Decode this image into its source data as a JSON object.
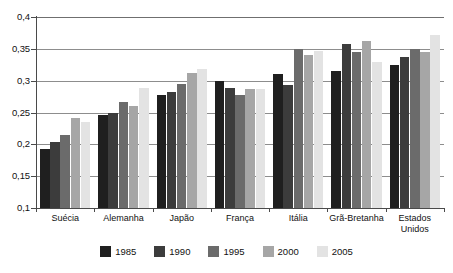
{
  "chart_data": {
    "type": "bar",
    "title": "",
    "subtitle": "",
    "xlabel": "",
    "ylabel": "",
    "ylim": [
      0.1,
      0.4
    ],
    "y_ticks": [
      "0,1",
      "0,15",
      "0,2",
      "0,25",
      "0,3",
      "0,35",
      "0,4"
    ],
    "y_tick_values": [
      0.1,
      0.15,
      0.2,
      0.25,
      0.3,
      0.35,
      0.4
    ],
    "grid": true,
    "grid_axis": "y",
    "legend_position": "bottom",
    "decimal_separator": ",",
    "categories": [
      "Suécia",
      "Alemanha",
      "Japão",
      "França",
      "Itália",
      "Grã-Bretanha",
      "Estados\nUnidos"
    ],
    "series": [
      {
        "name": "1985",
        "color": "#1f1f1f",
        "values": [
          0.193,
          0.246,
          0.277,
          0.3,
          0.31,
          0.315,
          0.325
        ]
      },
      {
        "name": "1990",
        "color": "#3c3c3c",
        "values": [
          0.204,
          0.25,
          0.283,
          0.289,
          0.293,
          0.357,
          0.337
        ]
      },
      {
        "name": "1995",
        "color": "#6b6b6b",
        "values": [
          0.214,
          0.266,
          0.295,
          0.278,
          0.35,
          0.345,
          0.349
        ]
      },
      {
        "name": "2000",
        "color": "#a6a6a6",
        "values": [
          0.242,
          0.261,
          0.312,
          0.287,
          0.341,
          0.362,
          0.345
        ]
      },
      {
        "name": "2005",
        "color": "#e3e3e3",
        "values": [
          0.235,
          0.288,
          0.319,
          0.287,
          0.347,
          0.33,
          0.371
        ]
      }
    ]
  }
}
